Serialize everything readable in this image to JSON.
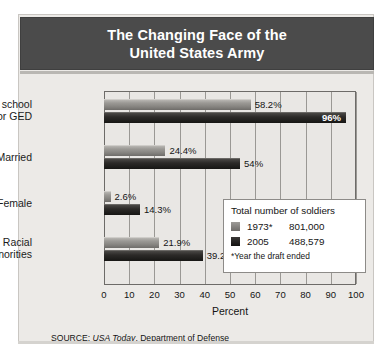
{
  "title": {
    "line1": "The Changing Face of the",
    "line2": "United States Army"
  },
  "legend": {
    "title": "Total number of soldiers",
    "entries": [
      {
        "year": "1973*",
        "value": "801,000",
        "color": "#84827e"
      },
      {
        "year": "2005",
        "value": "488,579",
        "color": "#1b1a18"
      }
    ],
    "note": "*Year the draft ended"
  },
  "source": {
    "prefix": "SOURCE: ",
    "italic": "USA Today",
    "suffix": ", Department of Defense"
  },
  "chart_data": {
    "type": "bar",
    "orientation": "horizontal",
    "title": "The Changing Face of the United States Army",
    "xlabel": "Percent",
    "ylabel": "",
    "xlim": [
      0,
      100
    ],
    "xticks": [
      "0",
      "10",
      "20",
      "30",
      "40",
      "50",
      "60",
      "70",
      "80",
      "90",
      "100"
    ],
    "grid": true,
    "legend_position": "inside-right",
    "categories": [
      "High school diploma or GED",
      "Married",
      "Female",
      "Racial minorities"
    ],
    "category_lines": [
      [
        "High school",
        "diploma or GED"
      ],
      [
        "Married"
      ],
      [
        "Female"
      ],
      [
        "Racial",
        "minorities"
      ]
    ],
    "series": [
      {
        "name": "1973*",
        "color": "#84827e",
        "values": [
          58.2,
          24.4,
          2.6,
          21.9
        ],
        "labels": [
          "58.2%",
          "24.4%",
          "2.6%",
          "21.9%"
        ]
      },
      {
        "name": "2005",
        "color": "#1b1a18",
        "values": [
          96,
          54,
          14.3,
          39.2
        ],
        "labels": [
          "96%",
          "54%",
          "14.3%",
          "39.2%"
        ]
      }
    ]
  }
}
